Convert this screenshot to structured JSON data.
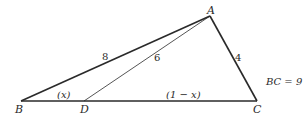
{
  "diagram": {
    "type": "triangle",
    "vertices": {
      "A": {
        "label": "A",
        "x": 210,
        "y": 16
      },
      "B": {
        "label": "B",
        "x": 21,
        "y": 101
      },
      "C": {
        "label": "C",
        "x": 257,
        "y": 101
      },
      "D": {
        "label": "D",
        "x": 84,
        "y": 101
      }
    },
    "segments": [
      {
        "from": "A",
        "to": "B",
        "label": "8",
        "weight": "bold"
      },
      {
        "from": "A",
        "to": "C",
        "label": "4",
        "weight": "bold"
      },
      {
        "from": "B",
        "to": "C",
        "label": "",
        "weight": "bold"
      },
      {
        "from": "A",
        "to": "D",
        "label": "6",
        "weight": "thin"
      }
    ],
    "segment_labels": {
      "BD": "(x)",
      "DC": "(1 − x)"
    },
    "annotation": "BC = 9",
    "colors": {
      "line": "#2a2a2a",
      "background": "#ffffff"
    }
  }
}
